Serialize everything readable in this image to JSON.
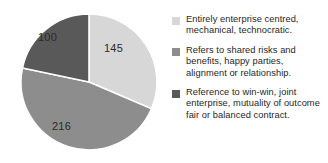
{
  "chart_data": {
    "type": "pie",
    "title": "",
    "categories": [
      "Entirely enterprise centred, mechanical, technocratic.",
      "Refers to shared risks and benefits, happy parties, alignment or relationship.",
      "Reference to win-win, joint enterprise, mutuality of outcome fair or balanced contract."
    ],
    "values": [
      145,
      216,
      100
    ],
    "total": 461,
    "colors": [
      "#d7d7d7",
      "#8d8d8d",
      "#595959"
    ],
    "start_angle_deg": 0,
    "direction": "clockwise",
    "legend_position": "right",
    "grid": false,
    "xlabel": "",
    "ylabel": ""
  },
  "slices": [
    {
      "value": "145",
      "color": "#d7d7d7",
      "name": "slice-entirely-enterprise-centred"
    },
    {
      "value": "216",
      "color": "#8d8d8d",
      "name": "slice-shared-risks-and-benefits"
    },
    {
      "value": "100",
      "color": "#595959",
      "name": "slice-win-win-joint-enterprise"
    }
  ],
  "legend": {
    "items": [
      {
        "swatch_color": "#d7d7d7",
        "label": "Entirely enterprise centred, mechanical, technocratic."
      },
      {
        "swatch_color": "#8d8d8d",
        "label": "Refers to shared risks and benefits, happy parties, alignment or relationship."
      },
      {
        "swatch_color": "#595959",
        "label": "Reference to win-win, joint enterprise, mutuality of outcome fair or balanced contract."
      }
    ]
  }
}
